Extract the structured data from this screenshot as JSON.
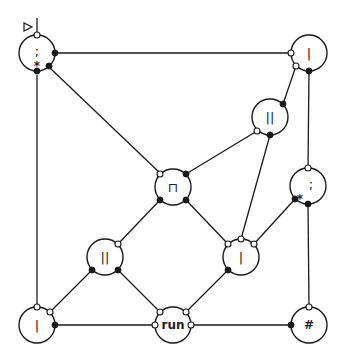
{
  "diagram": {
    "entry_marker": "▷",
    "nodes": [
      {
        "id": "n1",
        "label": ";",
        "x": 37,
        "y": 57,
        "star": true
      },
      {
        "id": "n2",
        "label": "|",
        "x": 309,
        "y": 53
      },
      {
        "id": "n3",
        "label": "||",
        "x": 270,
        "y": 117
      },
      {
        "id": "n4",
        "label": "⊓",
        "x": 173,
        "y": 187
      },
      {
        "id": "n5",
        "label": ";",
        "x": 308,
        "y": 186,
        "star": true
      },
      {
        "id": "n6",
        "label": "||",
        "x": 105,
        "y": 257
      },
      {
        "id": "n7",
        "label": "|",
        "x": 241,
        "y": 257
      },
      {
        "id": "n8",
        "label": "|",
        "x": 37,
        "y": 325
      },
      {
        "id": "n9",
        "label": "run",
        "x": 173,
        "y": 325,
        "bold": true
      },
      {
        "id": "n10",
        "label": "#",
        "x": 309,
        "y": 325
      }
    ]
  }
}
